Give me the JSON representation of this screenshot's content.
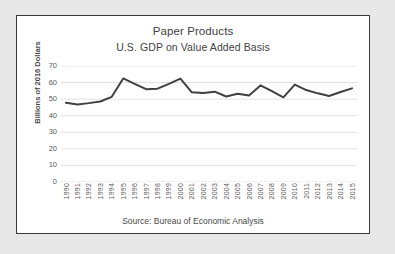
{
  "chart_data": {
    "type": "line",
    "title": "Paper Products",
    "subtitle": "U.S. GDP on Value Added Basis",
    "xlabel": "",
    "ylabel": "Billions of 2016 Dollars",
    "source": "Source: Bureau of Economic Analysis",
    "ylim": [
      0,
      70
    ],
    "ytick_step": 10,
    "ytick_labels": [
      "70",
      "60",
      "50",
      "40",
      "30",
      "20",
      "10",
      "0"
    ],
    "ytick_values": [
      70,
      60,
      50,
      40,
      30,
      20,
      10,
      0
    ],
    "grid": "horizontal",
    "legend": "none",
    "line_color": "#404040",
    "line_width": 2,
    "categories": [
      "1990",
      "1991",
      "1992",
      "1993",
      "1994",
      "1995",
      "1996",
      "1997",
      "1998",
      "1999",
      "2000",
      "2001",
      "2002",
      "2003",
      "2004",
      "2005",
      "2006",
      "2007",
      "2008",
      "2009",
      "2010",
      "2011",
      "2012",
      "2013",
      "2014",
      "2015"
    ],
    "values": [
      47.8,
      46.8,
      47.6,
      48.6,
      51.4,
      62.5,
      59.2,
      56.0,
      56.3,
      59.2,
      62.4,
      54.1,
      53.7,
      54.5,
      51.6,
      53.2,
      52.2,
      58.3,
      54.8,
      51.1,
      58.8,
      55.5,
      53.5,
      51.9,
      54.3,
      56.5
    ]
  },
  "page": {
    "background_color": "#e8e8e8",
    "frame_border_color": "#3a3a3a",
    "plot_background_color": "#ffffff",
    "gridline_color": "#e2e2e2"
  }
}
